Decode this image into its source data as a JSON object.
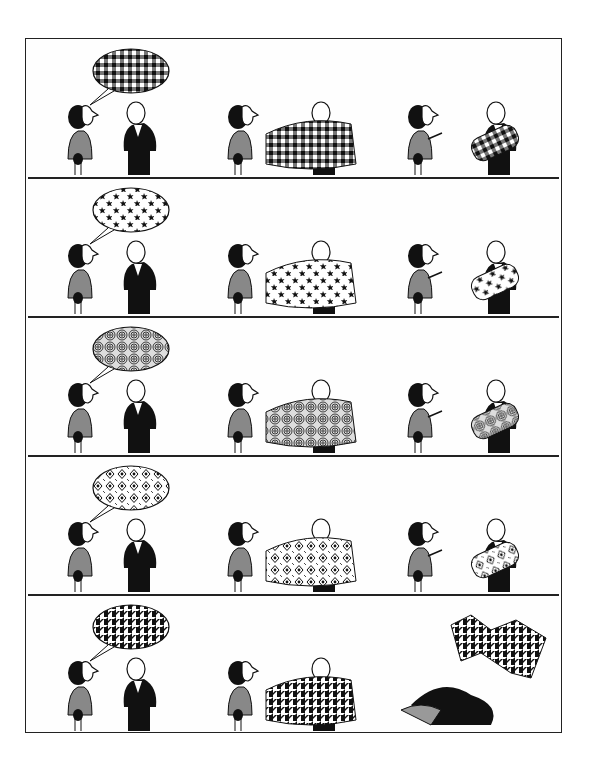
{
  "comic": {
    "title": "",
    "caption": "",
    "layout": {
      "rows": 5,
      "scenes_per_row": 3
    },
    "colors": {
      "ink": "#1a1a1a",
      "paper": "#ffffff",
      "frame": "#222222"
    },
    "rows": [
      {
        "pattern": "gingham",
        "scenes": [
          "woman-speaks-pattern-bubble",
          "man-unrolls-fabric",
          "woman-declines-man-holds-roll"
        ]
      },
      {
        "pattern": "stars",
        "scenes": [
          "woman-speaks-pattern-bubble",
          "man-unrolls-fabric",
          "woman-declines-man-holds-roll"
        ]
      },
      {
        "pattern": "swirls",
        "scenes": [
          "woman-speaks-pattern-bubble",
          "man-unrolls-fabric",
          "woman-declines-man-holds-roll"
        ]
      },
      {
        "pattern": "diamonds",
        "scenes": [
          "woman-speaks-pattern-bubble",
          "man-unrolls-fabric",
          "woman-declines-man-holds-roll"
        ]
      },
      {
        "pattern": "houndstooth",
        "scenes": [
          "woman-speaks-pattern-bubble",
          "man-unrolls-fabric",
          "man-attacks-woman-fabric-flies"
        ]
      }
    ]
  }
}
